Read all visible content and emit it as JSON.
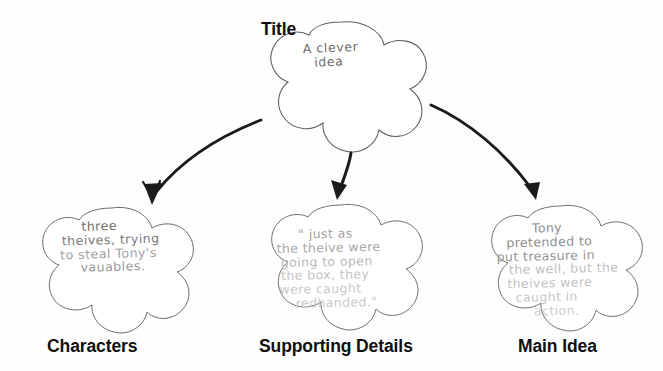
{
  "page": {
    "kind": "story-map-graphic-organizer",
    "background_color": "#fefefe",
    "ink_color": "#111111",
    "pencil_color": "#8d8b8b",
    "bubble_outline_color": "#5a5a5a"
  },
  "nodes": {
    "title": {
      "printed_label": "Title",
      "handwriting_lines": [
        "A clever",
        "idea"
      ],
      "shape": "cloud-blob-5-lobe",
      "center": [
        340,
        86
      ]
    },
    "characters": {
      "printed_label": "Characters",
      "handwriting_lines": [
        "three",
        "theives, trying",
        "to steal Tony's",
        "vauables."
      ],
      "shape": "cloud-blob-5-lobe",
      "center": [
        111,
        269
      ]
    },
    "supporting_details": {
      "printed_label": "Supporting Details",
      "handwriting_lines": [
        "\" just as",
        "the theive were",
        "going to open",
        "the box, they",
        "were caught",
        "redhanded.\""
      ],
      "shape": "cloud-blob-5-lobe",
      "center": [
        340,
        269
      ]
    },
    "main_idea": {
      "printed_label": "Main Idea",
      "handwriting_lines": [
        "Tony",
        "pretended to",
        "put treasure in",
        "the well, but the",
        "theives were",
        "caught in",
        "action."
      ],
      "shape": "cloud-blob-5-lobe",
      "center": [
        560,
        269
      ]
    }
  },
  "connectors": [
    {
      "name": "title-to-characters",
      "from": "title",
      "to": "characters",
      "style": "curved-arrow",
      "direction": "down-left"
    },
    {
      "name": "title-to-supporting-details",
      "from": "title",
      "to": "supporting_details",
      "style": "straight-arrow",
      "direction": "down"
    },
    {
      "name": "title-to-main-idea",
      "from": "title",
      "to": "main_idea",
      "style": "curved-arrow",
      "direction": "down-right"
    }
  ]
}
